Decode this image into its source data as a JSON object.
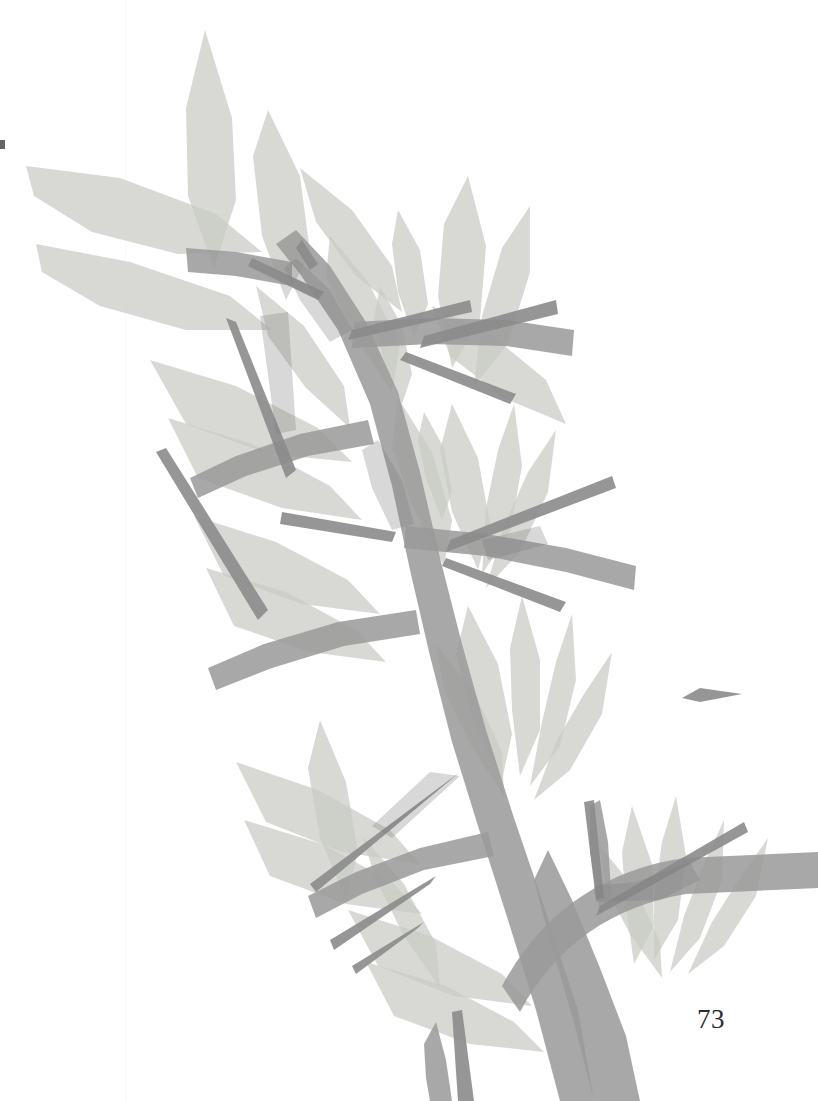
{
  "page": {
    "kind": "scanned-book-page",
    "page_number": "73",
    "background_color": "#ffffff",
    "width": 818,
    "height": 1101
  },
  "artwork": {
    "title": "Thorny branch with lance-shaped leaves",
    "style": "flat translucent grayscale silhouette illustration",
    "colors": {
      "background": "#ffffff",
      "leaf": "#c9cac5",
      "leaf_overlap": "#b4b5b0",
      "branch": "#9a9a9a",
      "branch_dark": "#8b8b8b",
      "branch_leaf_overlap": "#7d7d7d",
      "thorn_dark": "#7a7a7a"
    },
    "leaf_opacity": 0.62,
    "branch_opacity": 0.78,
    "elements": {
      "main_trunk": "diagonal stem from bottom-center rising to upper-left",
      "side_branch": "lower-right horizontal branch toward page edge",
      "leaf_clusters": 6,
      "thorns": 12
    }
  },
  "marks": {
    "edge_speck": "scan artifact at left margin",
    "fold_seam": "faint vertical scan seam"
  }
}
